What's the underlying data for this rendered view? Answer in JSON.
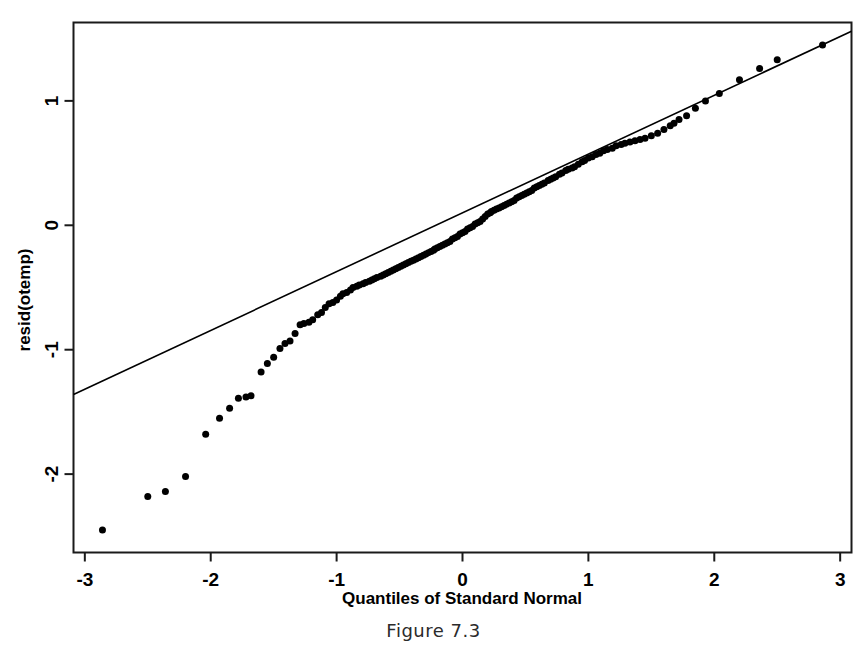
{
  "figure": {
    "caption": "Figure 7.3"
  },
  "chart_data": {
    "type": "scatter",
    "title": "",
    "xlabel": "Quantiles of Standard Normal",
    "ylabel": "resid(otemp)",
    "xlim": [
      -3.09,
      3.09
    ],
    "ylim": [
      -2.63,
      1.63
    ],
    "xticks": [
      -3,
      -2,
      -1,
      0,
      1,
      2,
      3
    ],
    "xticklabels": [
      "-3",
      "-2",
      "-1",
      "0",
      "1",
      "2",
      "3"
    ],
    "yticks": [
      1,
      0,
      -1,
      -2
    ],
    "yticklabels": [
      "1",
      "0",
      "-1",
      "-2"
    ],
    "grid": false,
    "legend": null,
    "marker": "filled-circle",
    "marker_color": "#000000",
    "marker_size_px": 7,
    "reference_line": {
      "label": "qqline",
      "color": "#000000",
      "width_px": 1.6,
      "x_endpoints": [
        -3.09,
        3.09
      ],
      "y_endpoints": [
        -1.36,
        1.56
      ]
    },
    "series": [
      {
        "name": "resid(otemp) sample quantiles",
        "points": [
          [
            -2.86,
            -2.45
          ],
          [
            -2.5,
            -2.18
          ],
          [
            -2.36,
            -2.14
          ],
          [
            -2.2,
            -2.02
          ],
          [
            -2.04,
            -1.68
          ],
          [
            -1.93,
            -1.55
          ],
          [
            -1.85,
            -1.47
          ],
          [
            -1.78,
            -1.39
          ],
          [
            -1.72,
            -1.38
          ],
          [
            -1.68,
            -1.37
          ],
          [
            -1.6,
            -1.18
          ],
          [
            -1.55,
            -1.11
          ],
          [
            -1.5,
            -1.06
          ],
          [
            -1.45,
            -0.99
          ],
          [
            -1.41,
            -0.95
          ],
          [
            -1.37,
            -0.93
          ],
          [
            -1.33,
            -0.87
          ],
          [
            -1.29,
            -0.8
          ],
          [
            -1.26,
            -0.79
          ],
          [
            -1.22,
            -0.78
          ],
          [
            -1.19,
            -0.76
          ],
          [
            -1.15,
            -0.72
          ],
          [
            -1.12,
            -0.7
          ],
          [
            -1.09,
            -0.66
          ],
          [
            -1.06,
            -0.63
          ],
          [
            -1.03,
            -0.62
          ],
          [
            -1.0,
            -0.6
          ],
          [
            -0.97,
            -0.57
          ],
          [
            -0.95,
            -0.55
          ],
          [
            -0.92,
            -0.54
          ],
          [
            -0.89,
            -0.52
          ],
          [
            -0.87,
            -0.5
          ],
          [
            -0.84,
            -0.49
          ],
          [
            -0.82,
            -0.48
          ],
          [
            -0.79,
            -0.47
          ],
          [
            -0.77,
            -0.46
          ],
          [
            -0.74,
            -0.45
          ],
          [
            -0.72,
            -0.44
          ],
          [
            -0.7,
            -0.43
          ],
          [
            -0.68,
            -0.42
          ],
          [
            -0.65,
            -0.41
          ],
          [
            -0.63,
            -0.4
          ],
          [
            -0.61,
            -0.39
          ],
          [
            -0.59,
            -0.38
          ],
          [
            -0.57,
            -0.37
          ],
          [
            -0.55,
            -0.36
          ],
          [
            -0.53,
            -0.35
          ],
          [
            -0.51,
            -0.34
          ],
          [
            -0.49,
            -0.33
          ],
          [
            -0.47,
            -0.32
          ],
          [
            -0.45,
            -0.31
          ],
          [
            -0.43,
            -0.3
          ],
          [
            -0.41,
            -0.29
          ],
          [
            -0.39,
            -0.28
          ],
          [
            -0.37,
            -0.27
          ],
          [
            -0.35,
            -0.26
          ],
          [
            -0.33,
            -0.25
          ],
          [
            -0.31,
            -0.24
          ],
          [
            -0.29,
            -0.23
          ],
          [
            -0.27,
            -0.22
          ],
          [
            -0.25,
            -0.21
          ],
          [
            -0.23,
            -0.2
          ],
          [
            -0.22,
            -0.19
          ],
          [
            -0.2,
            -0.18
          ],
          [
            -0.18,
            -0.17
          ],
          [
            -0.16,
            -0.16
          ],
          [
            -0.14,
            -0.15
          ],
          [
            -0.12,
            -0.14
          ],
          [
            -0.1,
            -0.13
          ],
          [
            -0.08,
            -0.11
          ],
          [
            -0.06,
            -0.1
          ],
          [
            -0.04,
            -0.09
          ],
          [
            -0.02,
            -0.07
          ],
          [
            0.0,
            -0.06
          ],
          [
            0.02,
            -0.05
          ],
          [
            0.04,
            -0.03
          ],
          [
            0.06,
            -0.02
          ],
          [
            0.08,
            -0.01
          ],
          [
            0.1,
            0.01
          ],
          [
            0.12,
            0.02
          ],
          [
            0.14,
            0.03
          ],
          [
            0.16,
            0.05
          ],
          [
            0.18,
            0.07
          ],
          [
            0.2,
            0.09
          ],
          [
            0.22,
            0.1
          ],
          [
            0.23,
            0.11
          ],
          [
            0.25,
            0.12
          ],
          [
            0.27,
            0.13
          ],
          [
            0.29,
            0.14
          ],
          [
            0.31,
            0.15
          ],
          [
            0.33,
            0.16
          ],
          [
            0.35,
            0.17
          ],
          [
            0.37,
            0.18
          ],
          [
            0.39,
            0.19
          ],
          [
            0.41,
            0.2
          ],
          [
            0.43,
            0.22
          ],
          [
            0.45,
            0.23
          ],
          [
            0.47,
            0.24
          ],
          [
            0.49,
            0.25
          ],
          [
            0.51,
            0.26
          ],
          [
            0.53,
            0.27
          ],
          [
            0.55,
            0.28
          ],
          [
            0.57,
            0.3
          ],
          [
            0.59,
            0.31
          ],
          [
            0.61,
            0.32
          ],
          [
            0.63,
            0.33
          ],
          [
            0.65,
            0.34
          ],
          [
            0.68,
            0.36
          ],
          [
            0.7,
            0.37
          ],
          [
            0.72,
            0.38
          ],
          [
            0.74,
            0.39
          ],
          [
            0.77,
            0.41
          ],
          [
            0.79,
            0.42
          ],
          [
            0.82,
            0.44
          ],
          [
            0.84,
            0.45
          ],
          [
            0.87,
            0.46
          ],
          [
            0.89,
            0.47
          ],
          [
            0.92,
            0.49
          ],
          [
            0.95,
            0.51
          ],
          [
            0.97,
            0.52
          ],
          [
            1.0,
            0.54
          ],
          [
            1.03,
            0.55
          ],
          [
            1.06,
            0.57
          ],
          [
            1.09,
            0.58
          ],
          [
            1.12,
            0.6
          ],
          [
            1.15,
            0.61
          ],
          [
            1.19,
            0.62
          ],
          [
            1.22,
            0.64
          ],
          [
            1.26,
            0.65
          ],
          [
            1.29,
            0.66
          ],
          [
            1.33,
            0.67
          ],
          [
            1.37,
            0.68
          ],
          [
            1.41,
            0.69
          ],
          [
            1.45,
            0.7
          ],
          [
            1.5,
            0.72
          ],
          [
            1.55,
            0.74
          ],
          [
            1.6,
            0.77
          ],
          [
            1.65,
            0.8
          ],
          [
            1.68,
            0.82
          ],
          [
            1.72,
            0.85
          ],
          [
            1.78,
            0.88
          ],
          [
            1.85,
            0.94
          ],
          [
            1.93,
            1.0
          ],
          [
            2.04,
            1.06
          ],
          [
            2.2,
            1.17
          ],
          [
            2.36,
            1.26
          ],
          [
            2.5,
            1.33
          ],
          [
            2.86,
            1.45
          ]
        ]
      }
    ]
  }
}
